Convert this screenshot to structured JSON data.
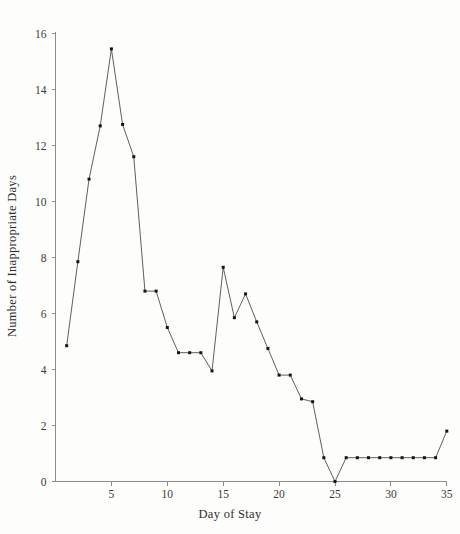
{
  "chart_data": {
    "type": "line",
    "title": "",
    "xlabel": "Day of Stay",
    "ylabel": "Number of Inappropriate Days",
    "xlim": [
      0,
      36
    ],
    "ylim": [
      0,
      16.6
    ],
    "grid": false,
    "legend": "none",
    "marker": "filled-square",
    "line_color": "#4d4d4d",
    "marker_color": "#151515",
    "background_color": "#fdfdfb",
    "axis_color": "#8c8c88",
    "x_ticks": [
      5,
      10,
      15,
      20,
      25,
      30,
      35
    ],
    "x_tick_labels": [
      "5",
      "10",
      "15",
      "20",
      "25",
      "30",
      "35"
    ],
    "y_ticks": [
      0,
      2,
      4,
      6,
      8,
      10,
      12,
      14,
      16
    ],
    "y_tick_labels": [
      "0",
      "2",
      "4",
      "6",
      "8",
      "10",
      "12",
      "14",
      "16"
    ],
    "x": [
      1,
      2,
      3,
      4,
      5,
      6,
      7,
      8,
      9,
      10,
      11,
      12,
      13,
      14,
      15,
      16,
      17,
      18,
      19,
      20,
      21,
      22,
      23,
      24,
      25,
      26,
      27,
      28,
      29,
      30,
      31,
      32,
      33,
      34,
      35
    ],
    "values": [
      4.85,
      7.85,
      10.8,
      12.7,
      15.45,
      12.75,
      11.6,
      6.8,
      6.8,
      5.5,
      4.6,
      4.6,
      4.6,
      3.95,
      7.65,
      5.85,
      6.7,
      5.7,
      4.75,
      3.8,
      3.8,
      2.95,
      2.85,
      0.85,
      0.0,
      0.85,
      0.85,
      0.85,
      0.85,
      0.85,
      0.85,
      0.85,
      0.85,
      0.85,
      1.8
    ],
    "series": [
      {
        "name": "Inappropriate Days",
        "values": [
          4.85,
          7.85,
          10.8,
          12.7,
          15.45,
          12.75,
          11.6,
          6.8,
          6.8,
          5.5,
          4.6,
          4.6,
          4.6,
          3.95,
          7.65,
          5.85,
          6.7,
          5.7,
          4.75,
          3.8,
          3.8,
          2.95,
          2.85,
          0.85,
          0.0,
          0.85,
          0.85,
          0.85,
          0.85,
          0.85,
          0.85,
          0.85,
          0.85,
          0.85,
          1.8
        ]
      }
    ]
  }
}
